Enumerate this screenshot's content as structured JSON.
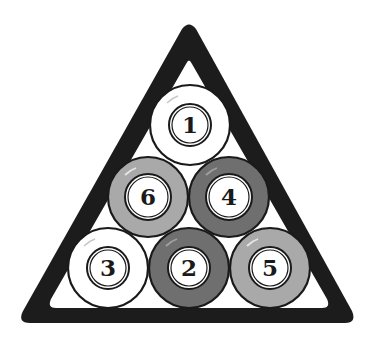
{
  "diagram": {
    "title": "",
    "rack": {
      "shape": "triangle",
      "frame_color": "#1c1c1c",
      "inner_color": "#ffffff"
    },
    "colors": {
      "white": "#ffffff",
      "light_gray": "#a9a9a9",
      "dark_gray": "#6f6f6f",
      "outline": "#1a1a1a"
    },
    "balls": [
      {
        "number": "1",
        "row": 1,
        "position": 1,
        "color": "white"
      },
      {
        "number": "6",
        "row": 2,
        "position": 1,
        "color": "light_gray"
      },
      {
        "number": "4",
        "row": 2,
        "position": 2,
        "color": "dark_gray"
      },
      {
        "number": "3",
        "row": 3,
        "position": 1,
        "color": "white"
      },
      {
        "number": "2",
        "row": 3,
        "position": 2,
        "color": "dark_gray"
      },
      {
        "number": "5",
        "row": 3,
        "position": 3,
        "color": "light_gray"
      }
    ]
  }
}
